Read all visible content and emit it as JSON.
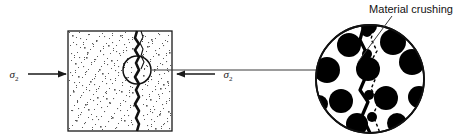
{
  "figure": {
    "background_color": "#ffffff",
    "line_color": "#1a1a1a",
    "aggregate_color": "#000000",
    "matrix_color": "#ffffff",
    "speckle_color": "#555555"
  },
  "annotations": {
    "material_crushing_label": "Material crushing",
    "stress_left_symbol": "σ",
    "stress_left_subscript": "2",
    "stress_right_symbol": "σ",
    "stress_right_subscript": "2"
  },
  "specimen": {
    "name": "speckled-specimen-block",
    "x": 68,
    "y": 31,
    "width": 104,
    "height": 100,
    "crack_x": 137
  },
  "detail_circle": {
    "name": "magnified-detail-circle",
    "cx": 370,
    "cy": 79,
    "r": 54
  },
  "callout_circle": {
    "name": "detail-indicator-circle",
    "cx": 137,
    "cy": 70,
    "r": 14
  },
  "leader_line": {
    "x1": 152,
    "y1": 70,
    "x2": 318,
    "y2": 70
  },
  "crushing_leader": {
    "x1": 392,
    "y1": 15,
    "x2": 360,
    "y2": 61
  },
  "arrows": {
    "left": {
      "x1": 28,
      "y1": 74,
      "x2": 67,
      "y2": 74,
      "direction": "right"
    },
    "right": {
      "x1": 215,
      "y1": 74,
      "x2": 176,
      "y2": 74,
      "direction": "left"
    }
  },
  "speckles": [
    [
      72,
      35
    ],
    [
      80,
      38
    ],
    [
      88,
      34
    ],
    [
      96,
      40
    ],
    [
      104,
      36
    ],
    [
      112,
      42
    ],
    [
      120,
      35
    ],
    [
      128,
      39
    ],
    [
      76,
      44
    ],
    [
      84,
      47
    ],
    [
      92,
      43
    ],
    [
      100,
      50
    ],
    [
      108,
      45
    ],
    [
      116,
      51
    ],
    [
      124,
      44
    ],
    [
      132,
      48
    ],
    [
      71,
      53
    ],
    [
      79,
      57
    ],
    [
      87,
      52
    ],
    [
      95,
      59
    ],
    [
      103,
      54
    ],
    [
      111,
      60
    ],
    [
      119,
      53
    ],
    [
      127,
      58
    ],
    [
      75,
      63
    ],
    [
      83,
      66
    ],
    [
      91,
      62
    ],
    [
      99,
      69
    ],
    [
      107,
      64
    ],
    [
      115,
      70
    ],
    [
      123,
      63
    ],
    [
      131,
      67
    ],
    [
      70,
      72
    ],
    [
      78,
      76
    ],
    [
      86,
      71
    ],
    [
      94,
      78
    ],
    [
      102,
      73
    ],
    [
      110,
      79
    ],
    [
      118,
      72
    ],
    [
      126,
      77
    ],
    [
      74,
      82
    ],
    [
      82,
      85
    ],
    [
      90,
      81
    ],
    [
      98,
      88
    ],
    [
      106,
      83
    ],
    [
      114,
      89
    ],
    [
      122,
      82
    ],
    [
      130,
      86
    ],
    [
      73,
      91
    ],
    [
      81,
      95
    ],
    [
      89,
      90
    ],
    [
      97,
      97
    ],
    [
      105,
      92
    ],
    [
      113,
      98
    ],
    [
      121,
      91
    ],
    [
      129,
      96
    ],
    [
      77,
      101
    ],
    [
      85,
      104
    ],
    [
      93,
      100
    ],
    [
      101,
      107
    ],
    [
      109,
      102
    ],
    [
      117,
      108
    ],
    [
      125,
      101
    ],
    [
      133,
      105
    ],
    [
      72,
      110
    ],
    [
      80,
      114
    ],
    [
      88,
      109
    ],
    [
      96,
      116
    ],
    [
      104,
      111
    ],
    [
      112,
      117
    ],
    [
      120,
      110
    ],
    [
      128,
      115
    ],
    [
      76,
      120
    ],
    [
      84,
      123
    ],
    [
      92,
      119
    ],
    [
      100,
      126
    ],
    [
      108,
      121
    ],
    [
      116,
      127
    ],
    [
      124,
      120
    ],
    [
      132,
      124
    ],
    [
      143,
      35
    ],
    [
      151,
      39
    ],
    [
      159,
      34
    ],
    [
      167,
      41
    ],
    [
      147,
      46
    ],
    [
      155,
      50
    ],
    [
      163,
      45
    ],
    [
      169,
      52
    ],
    [
      142,
      55
    ],
    [
      150,
      59
    ],
    [
      158,
      54
    ],
    [
      166,
      61
    ],
    [
      146,
      65
    ],
    [
      154,
      69
    ],
    [
      162,
      64
    ],
    [
      168,
      71
    ],
    [
      143,
      75
    ],
    [
      151,
      79
    ],
    [
      159,
      74
    ],
    [
      167,
      81
    ],
    [
      147,
      85
    ],
    [
      155,
      89
    ],
    [
      163,
      84
    ],
    [
      169,
      91
    ],
    [
      142,
      95
    ],
    [
      150,
      99
    ],
    [
      158,
      94
    ],
    [
      166,
      101
    ],
    [
      146,
      105
    ],
    [
      154,
      109
    ],
    [
      162,
      104
    ],
    [
      168,
      111
    ],
    [
      143,
      115
    ],
    [
      151,
      119
    ],
    [
      159,
      114
    ],
    [
      167,
      121
    ],
    [
      147,
      125
    ],
    [
      155,
      128
    ],
    [
      163,
      124
    ],
    [
      169,
      128
    ],
    [
      86,
      57
    ],
    [
      94,
      84
    ],
    [
      118,
      66
    ],
    [
      106,
      98
    ],
    [
      78,
      108
    ],
    [
      126,
      50
    ],
    [
      132,
      92
    ],
    [
      98,
      119
    ],
    [
      148,
      42
    ],
    [
      160,
      88
    ],
    [
      152,
      112
    ],
    [
      144,
      68
    ]
  ],
  "aggregates": [
    {
      "cx": 349,
      "cy": 45,
      "r": 12
    },
    {
      "cx": 393,
      "cy": 42,
      "r": 13
    },
    {
      "cx": 327,
      "cy": 70,
      "r": 13
    },
    {
      "cx": 368,
      "cy": 69,
      "r": 12
    },
    {
      "cx": 412,
      "cy": 62,
      "r": 13
    },
    {
      "cx": 341,
      "cy": 101,
      "r": 12
    },
    {
      "cx": 386,
      "cy": 98,
      "r": 12
    },
    {
      "cx": 419,
      "cy": 97,
      "r": 11
    },
    {
      "cx": 357,
      "cy": 124,
      "r": 11
    },
    {
      "cx": 397,
      "cy": 123,
      "r": 10
    },
    {
      "cx": 319,
      "cy": 104,
      "r": 9
    },
    {
      "cx": 369,
      "cy": 26,
      "r": 8
    },
    {
      "cx": 422,
      "cy": 44,
      "r": 7
    },
    {
      "cx": 312,
      "cy": 48,
      "r": 6
    }
  ],
  "crushing_nodes": [
    {
      "cx": 367,
      "cy": 32,
      "r": 5
    },
    {
      "cx": 367,
      "cy": 54,
      "r": 5
    },
    {
      "cx": 366,
      "cy": 75,
      "r": 5
    },
    {
      "cx": 369,
      "cy": 95,
      "r": 5
    },
    {
      "cx": 372,
      "cy": 117,
      "r": 5
    }
  ]
}
